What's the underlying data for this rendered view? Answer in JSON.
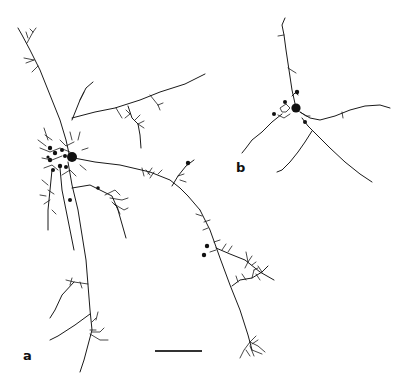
{
  "figure": {
    "panels": [
      {
        "id": "a",
        "label": "a",
        "description": "Traced cell with soma, dense perisomatic boutons, and long branching processes"
      },
      {
        "id": "b",
        "label": "b",
        "description": "Traced cell with soma and sparsely branched processes"
      }
    ],
    "scale_bar": {
      "label": ""
    }
  }
}
